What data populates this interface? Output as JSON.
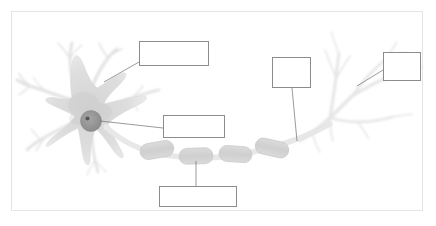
{
  "figure": {
    "background_color": "#ffffff",
    "border_color": "#e4e4e4",
    "box_border_color": "#8c8c8c",
    "leader_line_color": "#6e6e6e"
  },
  "colors": {
    "soma_fill": "#dcdcdc",
    "soma_stroke": "#d0d0d0",
    "nucleus_fill": "#9a9a9a",
    "nucleolus_fill": "#555555",
    "myelin_fill": "#d2d2d2",
    "myelin_stroke": "#c2c2c2",
    "axon_fill": "#e6e6e6",
    "dendrite_fill": "#e9e9e9"
  },
  "structures": [
    {
      "name": "dendrites",
      "description": "branching processes radiating from the cell body"
    },
    {
      "name": "soma",
      "description": "star-shaped cell body"
    },
    {
      "name": "nucleus",
      "description": "dark round nucleus with nucleolus inside the soma"
    },
    {
      "name": "axon",
      "description": "long process extending to the right"
    },
    {
      "name": "myelin-sheath",
      "description": "four capsule-shaped segments along the axon"
    },
    {
      "name": "nodes-of-ranvier",
      "description": "gaps between myelin segments"
    },
    {
      "name": "axon-terminals",
      "description": "branching endings at the upper right"
    }
  ],
  "label_boxes": [
    {
      "id": "dendrite",
      "text": "",
      "x": 139,
      "y": 41,
      "width": 70,
      "height": 25
    },
    {
      "id": "nucleus",
      "text": "",
      "x": 163,
      "y": 115,
      "width": 62,
      "height": 23
    },
    {
      "id": "myelin",
      "text": "",
      "x": 159,
      "y": 186,
      "width": 78,
      "height": 21
    },
    {
      "id": "axon",
      "text": "",
      "x": 272,
      "y": 57,
      "width": 39,
      "height": 31
    },
    {
      "id": "terminal",
      "text": "",
      "x": 383,
      "y": 52,
      "width": 38,
      "height": 29
    }
  ],
  "leader_lines": [
    {
      "id": "dendrite-leader",
      "from": [
        104,
        82
      ],
      "to": [
        139,
        62
      ]
    },
    {
      "id": "nucleus-leader",
      "from": [
        100,
        121
      ],
      "to": [
        163,
        128
      ]
    },
    {
      "id": "myelin-leader",
      "from": [
        196,
        161
      ],
      "to": [
        196,
        186
      ]
    },
    {
      "id": "axon-leader",
      "from": [
        292,
        88
      ],
      "to": [
        297,
        141
      ]
    },
    {
      "id": "terminal-leader",
      "from": [
        357,
        86
      ],
      "to": [
        383,
        70
      ]
    }
  ],
  "myelin_segments": [
    {
      "index": 1,
      "cx": 157,
      "cy": 150,
      "rx": 17,
      "ry": 8,
      "rotate": -10
    },
    {
      "index": 2,
      "cx": 196,
      "cy": 156,
      "rx": 17,
      "ry": 8,
      "rotate": -2
    },
    {
      "index": 3,
      "cx": 235,
      "cy": 154,
      "rx": 16,
      "ry": 8,
      "rotate": 4
    },
    {
      "index": 4,
      "cx": 272,
      "cy": 148,
      "rx": 17,
      "ry": 8,
      "rotate": 13
    }
  ]
}
